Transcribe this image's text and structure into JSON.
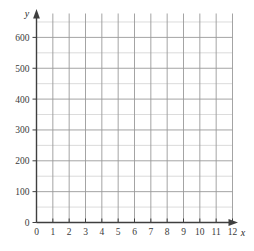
{
  "chart_data": {
    "type": "scatter",
    "title": "",
    "subtitle": "",
    "xlabel": "x",
    "ylabel": "y",
    "x": [],
    "values": [],
    "series": [],
    "annotations": [],
    "legend": [],
    "legend_position": "none",
    "grid": true,
    "xlim": [
      0,
      12.8
    ],
    "ylim": [
      0,
      675
    ],
    "x_ticks": [
      0,
      1,
      2,
      3,
      4,
      5,
      6,
      7,
      8,
      9,
      10,
      11,
      12
    ],
    "x_tick_labels": [
      "0",
      "1",
      "2",
      "3",
      "4",
      "5",
      "6",
      "7",
      "8",
      "9",
      "10",
      "11",
      "12"
    ],
    "y_ticks": [
      0,
      100,
      200,
      300,
      400,
      500,
      600
    ],
    "y_tick_labels": [
      "0",
      "100",
      "200",
      "300",
      "400",
      "500",
      "600"
    ],
    "x_minor_step": 1,
    "y_minor_step": 50
  },
  "axes": {
    "x_name": "x",
    "y_name": "y",
    "origin_label": "0"
  },
  "colors": {
    "background": "#ffffff",
    "axis": "#3f3f3f",
    "grid_major": "#9a9a9a",
    "grid_minor": "#d2d2d2",
    "tick_text": "#3a3a3a"
  }
}
